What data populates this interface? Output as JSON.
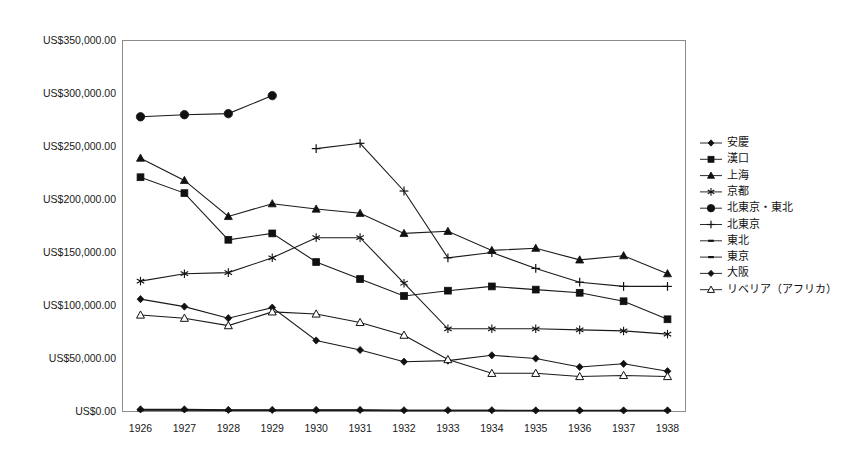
{
  "chart_data": {
    "type": "line",
    "title": "",
    "xlabel": "",
    "ylabel": "",
    "categories": [
      "1926",
      "1927",
      "1928",
      "1929",
      "1930",
      "1931",
      "1932",
      "1933",
      "1934",
      "1935",
      "1936",
      "1937",
      "1938"
    ],
    "x": [
      1926,
      1927,
      1928,
      1929,
      1930,
      1931,
      1932,
      1933,
      1934,
      1935,
      1936,
      1937,
      1938
    ],
    "ylim": [
      0,
      350000
    ],
    "ytick_values": [
      0,
      50000,
      100000,
      150000,
      200000,
      250000,
      300000,
      350000
    ],
    "ytick_labels": [
      "US$0.00",
      "US$50,000.00",
      "US$100,000.00",
      "US$150,000.00",
      "US$200,000.00",
      "US$250,000.00",
      "US$300,000.00",
      "US$350,000.00"
    ],
    "grid": false,
    "legend_position": "right",
    "currency_prefix": "US$",
    "series": [
      {
        "name": "安慶",
        "marker": "diamond-filled",
        "values": [
          2000,
          2000,
          1500,
          1500,
          1500,
          1500,
          1200,
          1200,
          1200,
          1000,
          1000,
          1000,
          1000
        ]
      },
      {
        "name": "漢口",
        "marker": "square-filled",
        "values": [
          221000,
          206000,
          162000,
          168000,
          141000,
          125000,
          109000,
          114000,
          118000,
          115000,
          112000,
          104000,
          87000
        ]
      },
      {
        "name": "上海",
        "marker": "triangle-filled",
        "values": [
          239000,
          218000,
          184000,
          196000,
          191000,
          187000,
          168000,
          170000,
          152000,
          154000,
          143000,
          147000,
          130000
        ]
      },
      {
        "name": "京都",
        "marker": "star",
        "values": [
          123000,
          130000,
          131000,
          145000,
          164000,
          164000,
          121000,
          78000,
          78000,
          78000,
          77000,
          76000,
          73000
        ]
      },
      {
        "name": "北東京・東北",
        "marker": "circle-filled",
        "values": [
          278000,
          280000,
          281000,
          298000,
          null,
          null,
          null,
          null,
          null,
          null,
          null,
          null,
          null
        ]
      },
      {
        "name": "北東京",
        "marker": "plus",
        "values": [
          null,
          null,
          null,
          null,
          248000,
          253000,
          208000,
          145000,
          150000,
          135000,
          122000,
          118000,
          118000
        ]
      },
      {
        "name": "東北",
        "marker": "line",
        "values": [
          1500,
          1500,
          1200,
          1200,
          1200,
          1200,
          1000,
          1000,
          1000,
          900,
          900,
          900,
          900
        ]
      },
      {
        "name": "東京",
        "marker": "line",
        "values": [
          1200,
          1200,
          1000,
          1000,
          1000,
          1000,
          800,
          800,
          800,
          700,
          700,
          700,
          700
        ]
      },
      {
        "name": "大阪",
        "marker": "diamond-filled",
        "values": [
          106000,
          99000,
          88000,
          98000,
          67000,
          58000,
          47000,
          48000,
          53000,
          50000,
          42000,
          45000,
          38000
        ]
      },
      {
        "name": "リベリア（アフリカ）",
        "marker": "triangle-open",
        "values": [
          91000,
          88000,
          81000,
          94000,
          92000,
          84000,
          72000,
          49000,
          36000,
          36000,
          33000,
          34000,
          33000
        ]
      }
    ]
  },
  "legend": {
    "items": [
      {
        "label": "安慶",
        "marker": "diamond-filled"
      },
      {
        "label": "漢口",
        "marker": "square-filled"
      },
      {
        "label": "上海",
        "marker": "triangle-filled"
      },
      {
        "label": "京都",
        "marker": "star"
      },
      {
        "label": "北東京・東北",
        "marker": "circle-filled"
      },
      {
        "label": "北東京",
        "marker": "plus"
      },
      {
        "label": "東北",
        "marker": "line"
      },
      {
        "label": "東京",
        "marker": "line"
      },
      {
        "label": "大阪",
        "marker": "diamond-filled"
      },
      {
        "label": "リベリア（アフリカ）",
        "marker": "triangle-open"
      }
    ]
  }
}
